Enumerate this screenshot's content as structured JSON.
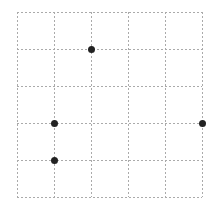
{
  "grid": {
    "columns": 5,
    "rows": 5,
    "origin_x": 17,
    "origin_y": 12,
    "cell_size": 37,
    "line_color": "#aaaaaa",
    "line_style": "dotted"
  },
  "points": [
    {
      "col": 2,
      "row": 1
    },
    {
      "col": 1,
      "row": 3
    },
    {
      "col": 1,
      "row": 4
    },
    {
      "col": 5,
      "row": 3
    }
  ],
  "point_color": "#222222",
  "point_radius": 3.5
}
